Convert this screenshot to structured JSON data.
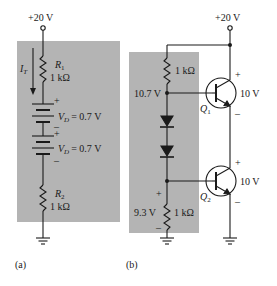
{
  "colors": {
    "panel_fill": "#b4b4b4",
    "wire": "#1a1a1a",
    "background": "#ffffff"
  },
  "circuit_a": {
    "label": "(a)",
    "supply": "+20 V",
    "current_label": "I",
    "current_subscript": "T",
    "r1": {
      "name": "R",
      "sub": "1",
      "value": "1 kΩ"
    },
    "diode1": {
      "name": "V",
      "sub": "D",
      "eq": "= 0.7 V",
      "plus": "+",
      "minus": "–"
    },
    "diode2": {
      "name": "V",
      "sub": "D",
      "eq": "= 0.7 V",
      "plus": "+",
      "minus": "–"
    },
    "r2": {
      "name": "R",
      "sub": "2",
      "value": "1 kΩ"
    }
  },
  "circuit_b": {
    "label": "(b)",
    "supply": "+20 V",
    "r_top": {
      "value": "1 kΩ"
    },
    "node_top_voltage": "10.7 V",
    "node_bottom_voltage": "9.3 V",
    "r_bottom": {
      "value": "1 kΩ",
      "plus": "+",
      "minus": "–"
    },
    "q1": {
      "name": "Q",
      "sub": "1",
      "vce": "10 V",
      "plus": "+",
      "minus": "–"
    },
    "q2": {
      "name": "Q",
      "sub": "2",
      "vce": "10 V",
      "plus": "+",
      "minus": "–"
    }
  }
}
